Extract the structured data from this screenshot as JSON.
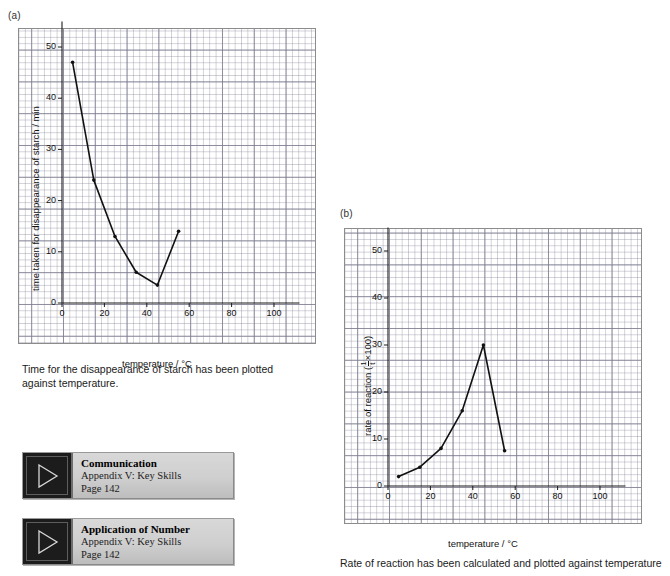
{
  "panels": {
    "a_label": "(a)",
    "b_label": "(b)"
  },
  "captions": {
    "a": "Time for the disappearance of starch has been plotted against temperature.",
    "b": "Rate of reaction has been calculated and plotted against temperature"
  },
  "chart_data": [
    {
      "id": "chart-a",
      "type": "line",
      "title": "",
      "panel": "(a)",
      "xlabel": "temperature / °C",
      "ylabel": "time taken for disappearance of starch / min",
      "xlim": [
        0,
        112
      ],
      "ylim": [
        0,
        55
      ],
      "xticks": [
        0,
        20,
        40,
        60,
        80,
        100
      ],
      "yticks": [
        0,
        10,
        20,
        30,
        40,
        50
      ],
      "xtick_labels": [
        "0",
        "20",
        "40",
        "60",
        "80",
        "100"
      ],
      "ytick_labels": [
        "0",
        "10",
        "20",
        "30",
        "40",
        "50"
      ],
      "grid": true,
      "legend": "none",
      "x": [
        5,
        15,
        25,
        35,
        45,
        55
      ],
      "values": [
        47,
        24,
        13,
        6,
        3.5,
        14
      ],
      "marker": "dot"
    },
    {
      "id": "chart-b",
      "type": "line",
      "title": "",
      "panel": "(b)",
      "xlabel": "temperature / °C",
      "ylabel_prefix": "rate of reaction (",
      "ylabel_frac_num": "1",
      "ylabel_frac_den": "t",
      "ylabel_suffix": "×100)",
      "ylabel": "rate of reaction (1/t ×100)",
      "xlim": [
        0,
        112
      ],
      "ylim": [
        0,
        55
      ],
      "xticks": [
        0,
        20,
        40,
        60,
        80,
        100
      ],
      "yticks": [
        0,
        10,
        20,
        30,
        40,
        50
      ],
      "xtick_labels": [
        "0",
        "20",
        "40",
        "60",
        "80",
        "100"
      ],
      "ytick_labels": [
        "0",
        "10",
        "20",
        "30",
        "40",
        "50"
      ],
      "grid": true,
      "legend": "none",
      "x": [
        5,
        15,
        25,
        35,
        45,
        55
      ],
      "values": [
        2,
        4,
        8,
        16,
        30,
        7.5
      ],
      "marker": "dot"
    }
  ],
  "key_skill_boxes": [
    {
      "title": "Communication",
      "subtitle": "Appendix V: Key Skills",
      "page": "Page 142",
      "icon": "play-triangle-icon"
    },
    {
      "title": "Application of Number",
      "subtitle": "Appendix V: Key Skills",
      "page": "Page 142",
      "icon": "play-triangle-icon"
    }
  ],
  "colors": {
    "line": "#111111",
    "grid_minor": "#8284963a",
    "grid_major": "#6e6e82bf",
    "frame": "#8c8c8c",
    "text": "#1a1a1a"
  }
}
